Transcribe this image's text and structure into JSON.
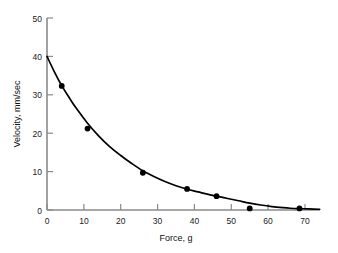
{
  "chart_data": {
    "type": "line",
    "title": "",
    "subtitle": "",
    "xlabel": "Force, g",
    "ylabel": "Velocity, mm/sec",
    "xlim": [
      0,
      74
    ],
    "ylim": [
      0,
      50
    ],
    "xticks": [
      0,
      10,
      20,
      30,
      40,
      50,
      60,
      70
    ],
    "xtick_labels": [
      "0",
      "10",
      "20",
      "30",
      "40",
      "50",
      "60",
      "70"
    ],
    "yticks": [
      0,
      10,
      20,
      30,
      40,
      50
    ],
    "ytick_labels": [
      "0",
      "10",
      "20",
      "30",
      "40",
      "50"
    ],
    "grid": false,
    "legend": null,
    "series": [
      {
        "name": "velocity-vs-force",
        "marker": "filled-circle",
        "marker_color": "#000000",
        "line_color": "#000000",
        "x": [
          4,
          11,
          26,
          38,
          46,
          55,
          68.5
        ],
        "values": [
          32.3,
          21.2,
          9.7,
          5.5,
          3.6,
          0.4,
          0.4
        ]
      }
    ],
    "fit_curve": {
      "description": "smooth exponential-decay curve through the data points",
      "x_start": 0,
      "y_start": 40.0,
      "x_end": 74,
      "y_end": 0.2,
      "points": [
        [
          0,
          40.0
        ],
        [
          2,
          36.0
        ],
        [
          4,
          32.4
        ],
        [
          6,
          29.3
        ],
        [
          8,
          26.4
        ],
        [
          11,
          22.6
        ],
        [
          14,
          19.3
        ],
        [
          17,
          16.5
        ],
        [
          20,
          14.2
        ],
        [
          23,
          12.1
        ],
        [
          26,
          10.2
        ],
        [
          29,
          8.7
        ],
        [
          32,
          7.4
        ],
        [
          35,
          6.3
        ],
        [
          38,
          5.4
        ],
        [
          41,
          4.7
        ],
        [
          44,
          4.0
        ],
        [
          46,
          3.6
        ],
        [
          49,
          3.0
        ],
        [
          52,
          2.4
        ],
        [
          55,
          1.8
        ],
        [
          58,
          1.3
        ],
        [
          61,
          0.9
        ],
        [
          64,
          0.6
        ],
        [
          66,
          0.45
        ],
        [
          68.5,
          0.35
        ],
        [
          71,
          0.28
        ],
        [
          74,
          0.2
        ]
      ]
    }
  },
  "axes": {
    "x_axis_name": "force-axis",
    "y_axis_name": "velocity-axis"
  }
}
